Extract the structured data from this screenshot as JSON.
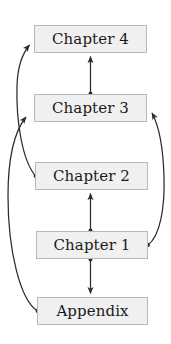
{
  "diagram": {
    "type": "dependency-graph",
    "style": {
      "node_fill": "#f0f0f0",
      "node_border": "#b8b8b8",
      "edge_color": "#2b2b2b",
      "text_color": "#1a1a1a",
      "background": "#ffffff"
    },
    "nodes": [
      {
        "id": "chapter4",
        "label": "Chapter 4",
        "x": 34,
        "y": 25,
        "width": 113,
        "height": 28
      },
      {
        "id": "chapter3",
        "label": "Chapter 3",
        "x": 34,
        "y": 94,
        "width": 113,
        "height": 28
      },
      {
        "id": "chapter2",
        "label": "Chapter 2",
        "x": 35,
        "y": 162,
        "width": 113,
        "height": 28
      },
      {
        "id": "chapter1",
        "label": "Chapter 1",
        "x": 36,
        "y": 231,
        "width": 112,
        "height": 28
      },
      {
        "id": "appendix",
        "label": "Appendix",
        "x": 37,
        "y": 297,
        "width": 111,
        "height": 28
      }
    ],
    "edges": [
      {
        "id": "edge-ch3-ch4",
        "from": "chapter3",
        "to": "chapter4",
        "shape": "straight",
        "direction": "up",
        "source_marker": "dot",
        "target_marker": "arrow"
      },
      {
        "id": "edge-ch1-ch2",
        "from": "chapter1",
        "to": "chapter2",
        "shape": "straight",
        "direction": "up",
        "source_marker": "dot",
        "target_marker": "arrow"
      },
      {
        "id": "edge-ch1-appendix",
        "from": "chapter1",
        "to": "appendix",
        "shape": "straight",
        "direction": "down",
        "source_marker": "dot",
        "target_marker": "arrow"
      },
      {
        "id": "edge-ch2-ch4",
        "from": "chapter2",
        "to": "chapter4",
        "shape": "curve-left",
        "direction": "up",
        "source_marker": "dot",
        "target_marker": "arrow"
      },
      {
        "id": "edge-appendix-ch3",
        "from": "appendix",
        "to": "chapter3",
        "shape": "curve-left-wide",
        "direction": "up",
        "source_marker": "dot",
        "target_marker": "arrow"
      },
      {
        "id": "edge-ch1-ch3",
        "from": "chapter1",
        "to": "chapter3",
        "shape": "curve-right",
        "direction": "up",
        "source_marker": "dot",
        "target_marker": "arrow"
      }
    ]
  }
}
